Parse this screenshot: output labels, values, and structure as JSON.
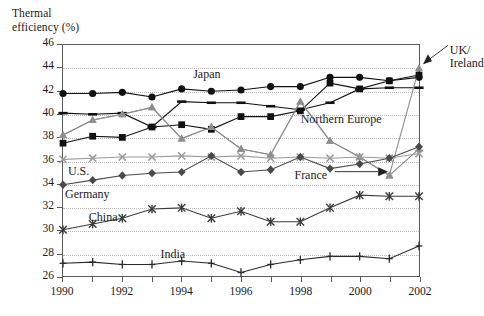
{
  "chart_data": {
    "type": "line",
    "title": "Thermal efficiency (%)",
    "ylabel": "Thermal efficiency (%)",
    "xlabel": "",
    "ylim": [
      26,
      46
    ],
    "xlim": [
      1990,
      2002
    ],
    "grid": true,
    "legend_position": "inline-annotations",
    "x": [
      1990,
      1991,
      1992,
      1993,
      1994,
      1995,
      1996,
      1997,
      1998,
      1999,
      2000,
      2001,
      2002
    ],
    "yticks": [
      26,
      28,
      30,
      32,
      34,
      36,
      38,
      40,
      42,
      44,
      46
    ],
    "xticks": [
      1990,
      1991,
      1992,
      1993,
      1994,
      1995,
      1996,
      1997,
      1998,
      1999,
      2000,
      2001,
      2002
    ],
    "xtick_labels": [
      "1990",
      "",
      "1992",
      "",
      "1994",
      "",
      "1996",
      "",
      "1998",
      "",
      "2000",
      "",
      "2002"
    ],
    "series": [
      {
        "name": "Japan",
        "marker": "circle",
        "color": "#111111",
        "values": [
          41.8,
          41.8,
          41.9,
          41.5,
          42.2,
          42.0,
          42.1,
          42.4,
          42.4,
          43.2,
          43.2,
          42.9,
          43.2
        ]
      },
      {
        "name": "Northern Europe",
        "marker": "dash",
        "color": "#111111",
        "values": [
          40.1,
          40.0,
          40.1,
          38.9,
          41.1,
          41.0,
          41.0,
          40.7,
          40.4,
          41.0,
          42.2,
          42.3,
          42.3
        ]
      },
      {
        "name": "UK/ Ireland",
        "marker": "triangle",
        "color": "#8e8e8e",
        "values": [
          38.2,
          39.5,
          40.0,
          40.6,
          37.9,
          38.9,
          37.0,
          36.5,
          41.1,
          37.7,
          36.3,
          34.7,
          44.0
        ]
      },
      {
        "name": "U.S.",
        "marker": "square",
        "color": "#111111",
        "values": [
          37.5,
          38.1,
          38.0,
          38.9,
          39.1,
          38.7,
          39.8,
          39.8,
          40.3,
          42.7,
          42.2,
          42.9,
          43.4
        ]
      },
      {
        "name": "France",
        "marker": "triangle",
        "color": "#8e8e8e",
        "values": [
          38.2,
          39.5,
          40.0,
          40.6,
          37.9,
          38.9,
          37.0,
          36.5,
          41.1,
          37.7,
          36.3,
          34.7,
          37.0
        ]
      },
      {
        "name": "U.S. grey",
        "marker": "cross",
        "color": "#9a9a9a",
        "values": [
          36.1,
          36.2,
          36.3,
          36.3,
          36.4,
          36.3,
          36.4,
          36.2,
          36.3,
          36.2,
          36.3,
          36.2,
          36.6
        ]
      },
      {
        "name": "Germany",
        "marker": "diamond",
        "color": "#4a4a4a",
        "values": [
          33.9,
          34.3,
          34.7,
          34.9,
          35.0,
          36.4,
          35.0,
          35.2,
          36.3,
          35.3,
          35.7,
          36.2,
          37.2
        ]
      },
      {
        "name": "China",
        "marker": "asterisk",
        "color": "#3a3a3a",
        "values": [
          30.0,
          30.5,
          31.0,
          31.8,
          31.9,
          31.0,
          31.6,
          30.7,
          30.7,
          31.9,
          33.0,
          32.9,
          32.9
        ]
      },
      {
        "name": "India",
        "marker": "plus",
        "color": "#2a2a2a",
        "values": [
          27.1,
          27.2,
          27.0,
          27.0,
          27.3,
          27.1,
          26.3,
          27.0,
          27.4,
          27.7,
          27.7,
          27.5,
          28.6
        ]
      }
    ],
    "annotations": [
      {
        "text": "Japan",
        "x": 1995.0,
        "y": 43.3
      },
      {
        "text": "Northern Europe",
        "x": 1998.2,
        "y": 39.5
      },
      {
        "text": "UK/\nIreland",
        "x": 2003.4,
        "y": 45.3
      },
      {
        "text": "U.S.",
        "x": 1990.2,
        "y": 35.0
      },
      {
        "text": "France",
        "x": 1999.2,
        "y": 34.7
      },
      {
        "text": "Germany",
        "x": 1990.1,
        "y": 33.0
      },
      {
        "text": "China",
        "x": 1990.9,
        "y": 31.1
      },
      {
        "text": "India",
        "x": 1993.3,
        "y": 27.9
      }
    ]
  },
  "ytick_labels": [
    "46",
    "44",
    "42",
    "40",
    "38",
    "36",
    "34",
    "32",
    "30",
    "28",
    "26"
  ],
  "xtick_labels": [
    "1990",
    "1992",
    "1994",
    "1996",
    "1998",
    "2000",
    "2002"
  ],
  "labels": {
    "axis_title": "Thermal\nefficiency (%)",
    "japan": "Japan",
    "northern_europe": "Northern Europe",
    "uk_ireland": "UK/\nIreland",
    "us": "U.S.",
    "france": "France",
    "germany": "Germany",
    "china": "China",
    "india": "India"
  }
}
